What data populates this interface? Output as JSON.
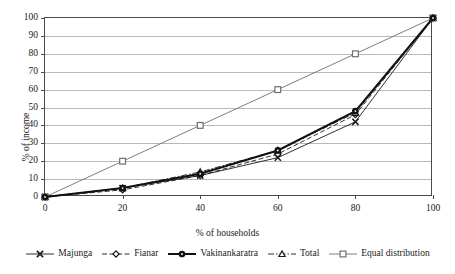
{
  "chart_data": {
    "type": "line",
    "title": "",
    "subtitle": "",
    "xlabel": "% of households",
    "ylabel": "% of income",
    "xlim": [
      0,
      100
    ],
    "ylim": [
      0,
      100
    ],
    "x": [
      0,
      20,
      40,
      60,
      80,
      100
    ],
    "xticks": [
      "0",
      "20",
      "40",
      "60",
      "80",
      "100"
    ],
    "yticks": [
      "0",
      "10",
      "20",
      "30",
      "40",
      "50",
      "60",
      "70",
      "80",
      "90",
      "100"
    ],
    "grid": "horizontal",
    "legend_position": "bottom",
    "series": [
      {
        "name": "Majunga",
        "marker": "x-cross",
        "color": "#1a1a1a",
        "line_style": "solid-thin",
        "values": [
          0,
          5,
          12,
          22,
          42,
          100
        ]
      },
      {
        "name": "Fianar",
        "marker": "diamond",
        "color": "#1a1a1a",
        "line_style": "dashed",
        "values": [
          0,
          4,
          12,
          24,
          46,
          100
        ]
      },
      {
        "name": "Vakinankaratra",
        "marker": "circle-filled",
        "color": "#111111",
        "line_style": "solid-thick",
        "values": [
          0,
          5,
          13,
          26,
          48,
          100
        ]
      },
      {
        "name": "Total",
        "marker": "triangle",
        "color": "#1a1a1a",
        "line_style": "dash-dot",
        "values": [
          0,
          5,
          14,
          26,
          47,
          100
        ]
      },
      {
        "name": "Equal distribution",
        "marker": "square",
        "color": "#6f6f6f",
        "line_style": "solid-thin",
        "values": [
          0,
          20,
          40,
          60,
          80,
          100
        ]
      }
    ]
  }
}
